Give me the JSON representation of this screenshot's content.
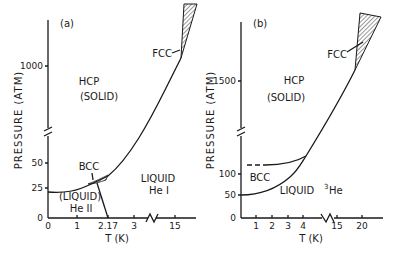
{
  "panels": [
    {
      "id": "a",
      "panel_label": "(a)",
      "ylabel": "PRESSURE (ATM)",
      "xlabel": "T (K)",
      "x_ticks": [
        "0",
        "1",
        "2.17",
        "3",
        "15"
      ],
      "y_ticks": [
        "0",
        "25",
        "50",
        "1000"
      ],
      "regions": {
        "hcp": "HCP",
        "solid": "(SOLID)",
        "fcc": "FCC",
        "bcc": "BCC",
        "liquid_he1_line1": "LIQUID",
        "liquid_he1_line2": "He I",
        "liquid_he2_line1": "(LIQUID)",
        "liquid_he2_line2": "He II"
      }
    },
    {
      "id": "b",
      "panel_label": "(b)",
      "ylabel": "PRESSURE (ATM)",
      "xlabel": "T (K)",
      "x_ticks": [
        "1",
        "2",
        "3",
        "4",
        "15",
        "20"
      ],
      "y_ticks": [
        "0",
        "50",
        "100",
        "1500"
      ],
      "regions": {
        "hcp": "HCP",
        "solid": "(SOLID)",
        "fcc": "FCC",
        "bcc": "BCC",
        "liquid": "LIQUID",
        "isotope": "3",
        "element": "He"
      }
    }
  ]
}
